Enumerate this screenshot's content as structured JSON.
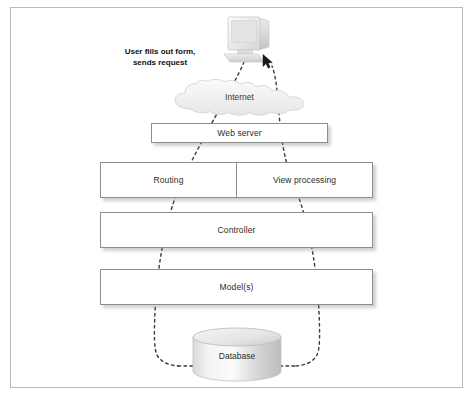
{
  "figure": {
    "type": "diagram",
    "caption": "",
    "frame_border_color": "#b9b9b9",
    "background_color": "#ffffff"
  },
  "annotations": [
    {
      "name": "user-action-note",
      "text": "User fills out form,\nsends request",
      "line1": "User fills out form,",
      "line2": "sends request",
      "bold": true
    }
  ],
  "nodes": {
    "computer": {
      "label": "",
      "icon": "desktop-computer-icon"
    },
    "cursor": {
      "icon": "mouse-cursor-icon"
    },
    "cloud": {
      "label": "Internet",
      "icon": "cloud-icon"
    },
    "web_server": {
      "label": "Web server",
      "shape": "rectangle"
    },
    "routing": {
      "label": "Routing",
      "shape": "rectangle"
    },
    "view_processing": {
      "label": "View processing",
      "shape": "rectangle"
    },
    "controller": {
      "label": "Controller",
      "shape": "rectangle"
    },
    "models": {
      "label": "Model(s)",
      "shape": "rectangle"
    },
    "database": {
      "label": "Database",
      "shape": "cylinder",
      "icon": "database-cylinder-icon"
    }
  },
  "flow": {
    "style": "dashed",
    "color": "#3a3a3a",
    "description": "Request travels from the user's computer down through the Internet, web server, routing, controller and model layers to the database, then the response returns back up through view processing to the user.",
    "request_path": [
      "computer",
      "internet",
      "web-server",
      "routing",
      "controller",
      "models",
      "database"
    ],
    "response_path": [
      "database",
      "models",
      "controller",
      "view-processing",
      "web-server",
      "internet",
      "computer"
    ]
  },
  "colors": {
    "box_border": "#8d8d8d",
    "box_fill": "#ffffff",
    "text": "#2b2b2b",
    "dash": "#3a3a3a",
    "shadow": "rgba(120,120,120,0.35)",
    "cloud_fill": "#f2f2f2",
    "cloud_stroke": "#cfcfcf",
    "cylinder_light": "#fbfbfb",
    "cylinder_dark": "#b8b8b8"
  }
}
